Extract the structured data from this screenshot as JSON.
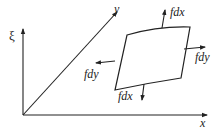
{
  "diagram": {
    "axes": {
      "vertical_label": "ξ",
      "diagonal_label": "y",
      "horizontal_label": "x"
    },
    "forces": {
      "top": "fdx",
      "right": "fdy",
      "left": "fdy",
      "bottom": "fdx"
    },
    "colors": {
      "stroke": "#222222",
      "background": "#ffffff"
    }
  }
}
